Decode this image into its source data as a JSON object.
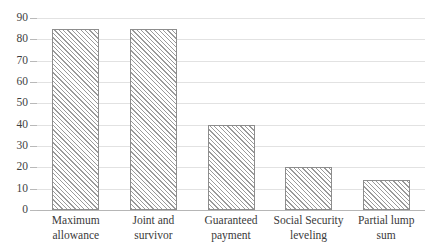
{
  "chart_data": {
    "type": "bar",
    "title": "",
    "subtitle": "",
    "xlabel": "",
    "ylabel": "",
    "categories": [
      "Maximum allowance",
      "Joint and survivor",
      "Guaranteed payment",
      "Social Security leveling",
      "Partial lump sum"
    ],
    "category_lines": [
      [
        "Maximum",
        "allowance"
      ],
      [
        "Joint and survivor",
        ""
      ],
      [
        "Guaranteed",
        "payment"
      ],
      [
        "Social Security",
        "leveling"
      ],
      [
        "Partial lump sum",
        ""
      ]
    ],
    "values": [
      85,
      85,
      40,
      20,
      14
    ],
    "ylim": [
      0,
      90
    ],
    "ytick_labels": [
      "90",
      "80",
      "70",
      "60",
      "50",
      "40",
      "30",
      "20",
      "10",
      "0"
    ],
    "ytick_values": [
      90,
      80,
      70,
      60,
      50,
      40,
      30,
      20,
      10,
      0
    ],
    "grid": true,
    "legend": "none",
    "colors": {
      "bar_fill": "#ffffff",
      "bar_hatch": "#9a9a9a",
      "bar_border": "#8d8d8d",
      "gridline": "#e2e2e2",
      "axis_line": "#b6b6b6",
      "text": "#3a3a3a",
      "background": "#ffffff"
    }
  }
}
